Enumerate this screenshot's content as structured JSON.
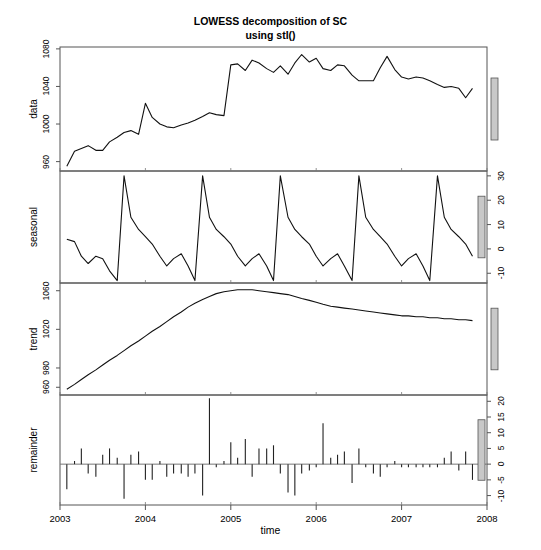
{
  "title": {
    "line1": "LOWESS decomposition of SC",
    "line2": "using stl()"
  },
  "axis": {
    "xlabel": "time",
    "xticks": [
      "2003",
      "2004",
      "2005",
      "2006",
      "2007",
      "2008"
    ]
  },
  "panels": {
    "data": {
      "label": "data",
      "yticks": [
        "960",
        "1000",
        "1040",
        "1080"
      ],
      "side": "left"
    },
    "seasonal": {
      "label": "seasonal",
      "yticks": [
        "-10",
        "0",
        "10",
        "20",
        "30"
      ],
      "side": "right"
    },
    "trend": {
      "label": "trend",
      "yticks": [
        "960",
        "980",
        "1020",
        "1060"
      ],
      "side": "left"
    },
    "remainder": {
      "label": "remainder",
      "yticks": [
        "-10",
        "-5",
        "0",
        "5",
        "10",
        "15",
        "20"
      ],
      "side": "right"
    }
  },
  "chart_data": {
    "type": "line",
    "title": "LOWESS decomposition of SC using stl()",
    "xlabel": "time",
    "ylabel": "",
    "grid": false,
    "legend": null,
    "xlim": [
      2003.0,
      2008.0
    ],
    "x": [
      2003.08,
      2003.17,
      2003.25,
      2003.33,
      2003.42,
      2003.5,
      2003.58,
      2003.67,
      2003.75,
      2003.83,
      2003.92,
      2004.0,
      2004.08,
      2004.17,
      2004.25,
      2004.33,
      2004.42,
      2004.5,
      2004.58,
      2004.67,
      2004.75,
      2004.83,
      2004.92,
      2005.0,
      2005.08,
      2005.17,
      2005.25,
      2005.33,
      2005.42,
      2005.5,
      2005.58,
      2005.67,
      2005.75,
      2005.83,
      2005.92,
      2006.0,
      2006.08,
      2006.17,
      2006.25,
      2006.33,
      2006.42,
      2006.5,
      2006.58,
      2006.67,
      2006.75,
      2006.83,
      2006.92,
      2007.0,
      2007.08,
      2007.17,
      2007.25,
      2007.33,
      2007.42,
      2007.5,
      2007.58,
      2007.67,
      2007.75,
      2007.83
    ],
    "panels": [
      {
        "name": "data",
        "ylabel": "data",
        "ylim": [
          950,
          1082
        ],
        "yticks": [
          960,
          1000,
          1040,
          1080
        ],
        "tick_side": "left",
        "style": "line",
        "values": [
          955,
          971,
          974,
          977,
          972,
          972,
          981,
          986,
          991,
          993,
          989,
          1022,
          1007,
          1000,
          997,
          996,
          999,
          1001,
          1004,
          1008,
          1012,
          1010,
          1009,
          1063,
          1064,
          1057,
          1068,
          1065,
          1059,
          1055,
          1062,
          1053,
          1065,
          1074,
          1066,
          1070,
          1059,
          1057,
          1063,
          1062,
          1052,
          1046,
          1046,
          1046,
          1060,
          1072,
          1058,
          1050,
          1048,
          1050,
          1049,
          1046,
          1042,
          1039,
          1040,
          1038,
          1028,
          1038
        ]
      },
      {
        "name": "seasonal",
        "ylabel": "seasonal",
        "ylim": [
          -14,
          32
        ],
        "yticks": [
          -10,
          0,
          10,
          20,
          30
        ],
        "tick_side": "right",
        "style": "line",
        "values": [
          4,
          3,
          -3,
          -6,
          -3,
          -4,
          -9,
          -13,
          30,
          13,
          8,
          5,
          2,
          -3,
          -7,
          -4,
          -2,
          -7,
          -13,
          30,
          13,
          8,
          5,
          2,
          -3,
          -7,
          -4,
          -2,
          -7,
          -13,
          30,
          13,
          8,
          5,
          2,
          -3,
          -7,
          -4,
          -2,
          -7,
          -13,
          30,
          13,
          8,
          5,
          2,
          -3,
          -7,
          -4,
          -2,
          -7,
          -13,
          30,
          13,
          8,
          5,
          2,
          -3
        ]
      },
      {
        "name": "trend",
        "ylabel": "trend",
        "ylim": [
          952,
          1068
        ],
        "yticks": [
          960,
          980,
          1020,
          1060
        ],
        "tick_side": "left",
        "style": "line",
        "values": [
          958,
          963,
          968,
          973,
          978,
          983,
          988,
          993,
          998,
          1003,
          1008,
          1013,
          1018,
          1023,
          1028,
          1033,
          1038,
          1043,
          1047,
          1051,
          1054,
          1057,
          1059,
          1060,
          1061,
          1061,
          1061,
          1060,
          1059,
          1058,
          1057,
          1056,
          1054,
          1052,
          1050,
          1048,
          1046,
          1044,
          1043,
          1042,
          1041,
          1040,
          1039,
          1038,
          1037,
          1036,
          1035,
          1034,
          1034,
          1033,
          1033,
          1032,
          1032,
          1031,
          1031,
          1030,
          1030,
          1029
        ]
      },
      {
        "name": "remainder",
        "ylabel": "remainder",
        "ylim": [
          -13,
          22
        ],
        "yticks": [
          -10,
          -5,
          0,
          5,
          10,
          15,
          20
        ],
        "tick_side": "right",
        "style": "spike",
        "baseline": 0,
        "values": [
          -8,
          1,
          5,
          -3,
          -4,
          3,
          5,
          2,
          -11,
          3,
          4,
          -5,
          -5,
          1,
          -4,
          -3,
          -3,
          -4,
          -3,
          -10,
          21,
          -1,
          1,
          7,
          2,
          8,
          -4,
          5,
          5,
          6,
          -3,
          -9,
          -10,
          -3,
          -2,
          -1,
          13,
          2,
          3,
          4,
          -6,
          5,
          -1,
          -3,
          -4,
          -1,
          1,
          -1,
          -1,
          -1,
          -1,
          -1,
          -1,
          2,
          4,
          -2,
          4,
          -5
        ]
      }
    ]
  }
}
